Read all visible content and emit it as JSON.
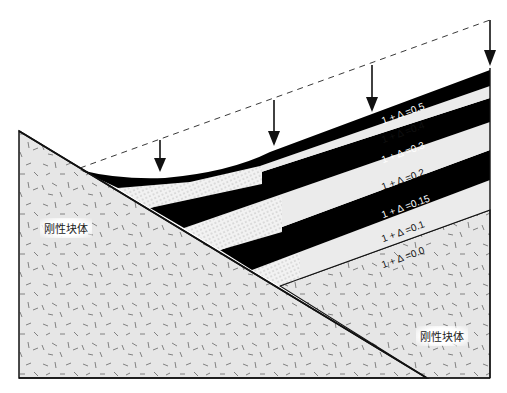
{
  "figure": {
    "type": "diagram",
    "colors": {
      "block_fill": "#e6e6e6",
      "layer_dark": "#000000",
      "layer_light": "#ebebeb",
      "outline": "#111111"
    },
    "blocks": [
      {
        "label": "刚性块体",
        "position": "left"
      },
      {
        "label": "刚性块体",
        "position": "lower-right"
      }
    ],
    "layers": [
      {
        "label": "1 + Δ =0.5",
        "shade": "dark"
      },
      {
        "label": "1 + Δ =0.4",
        "shade": "light"
      },
      {
        "label": "1 + Δ =0.3",
        "shade": "dark"
      },
      {
        "label": "1 + Δ =0.2",
        "shade": "light"
      },
      {
        "label": "1 + Δ =0.15",
        "shade": "dark"
      },
      {
        "label": "1 + Δ =0.1",
        "shade": "light"
      },
      {
        "label": "1 + Δ =0.0",
        "shade": "block"
      }
    ],
    "load_arrows": 4,
    "dashed_reference_line": true
  }
}
